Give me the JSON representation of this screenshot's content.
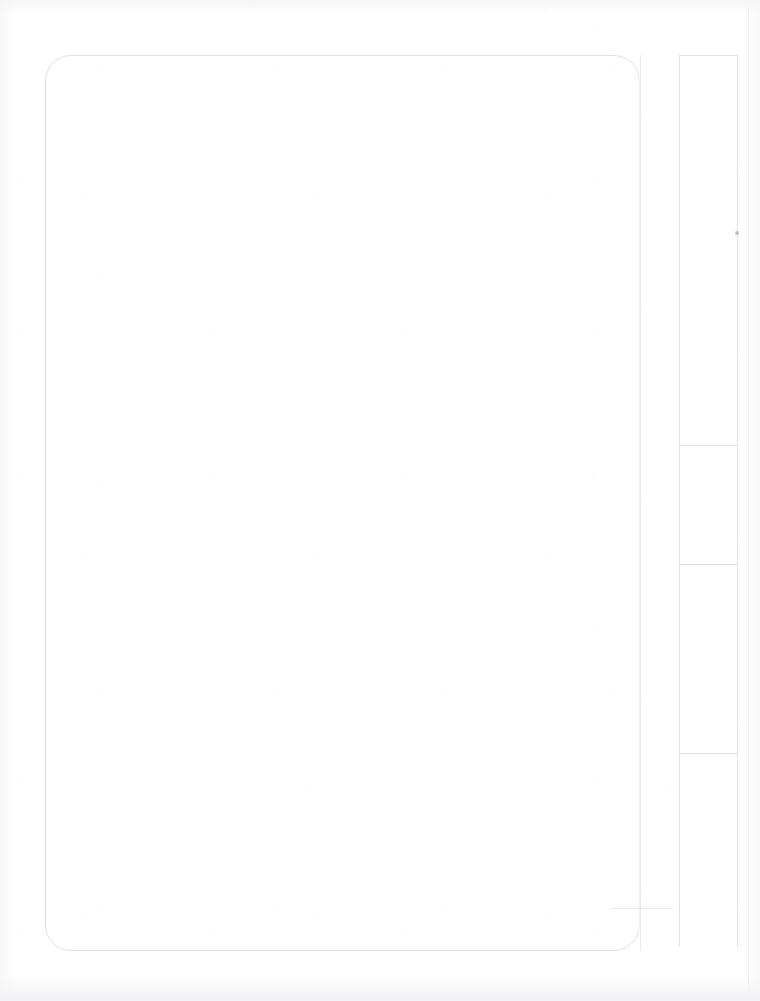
{
  "page": {
    "kind": "blank-scanned-page",
    "width": 760,
    "height": 1001,
    "background_color": "#ffffff",
    "rule_color": "#b4b6be",
    "artifact_color": "#787a84",
    "title": "",
    "body_text": "",
    "footer_text": ""
  },
  "main_frame": {
    "label": "",
    "body_text": "",
    "corner_radius": 26
  },
  "gutter": {
    "label": ""
  },
  "sidebar": {
    "label": "",
    "sections": [
      {
        "label": "",
        "top": 0,
        "height": 389
      },
      {
        "label": "",
        "top": 389,
        "height": 119
      },
      {
        "label": "",
        "top": 508,
        "height": 189
      },
      {
        "label": "",
        "top": 697,
        "height": 195
      }
    ]
  },
  "artifacts": {
    "speck_label": ""
  }
}
